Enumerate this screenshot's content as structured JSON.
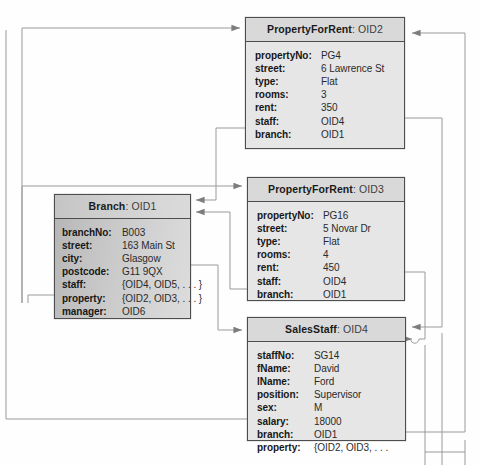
{
  "diagram": {
    "colors": {
      "box_border": "#4d4d4d",
      "title_fill": "#d9d9d9",
      "body_fill": "#e6e6e6",
      "branch_fill": "#c9c9c9",
      "connector": "#9a9a9a",
      "text": "#171717",
      "page": "#fefefe"
    },
    "objects": [
      {
        "id": "property-oid2",
        "class_name": "PropertyForRent",
        "separator": ":",
        "oid": "OID2",
        "attributes": [
          {
            "key": "propertyNo:",
            "value": "PG4"
          },
          {
            "key": "street:",
            "value": "6 Lawrence St"
          },
          {
            "key": "type:",
            "value": "Flat"
          },
          {
            "key": "rooms:",
            "value": "3"
          },
          {
            "key": "rent:",
            "value": "350"
          },
          {
            "key": "staff:",
            "value": "OID4"
          },
          {
            "key": "branch:",
            "value": "OID1"
          }
        ]
      },
      {
        "id": "property-oid3",
        "class_name": "PropertyForRent",
        "separator": ":",
        "oid": "OID3",
        "attributes": [
          {
            "key": "propertyNo:",
            "value": "PG16"
          },
          {
            "key": "street:",
            "value": "5 Novar Dr"
          },
          {
            "key": "type:",
            "value": "Flat"
          },
          {
            "key": "rooms:",
            "value": "4"
          },
          {
            "key": "rent:",
            "value": "450"
          },
          {
            "key": "staff:",
            "value": "OID4"
          },
          {
            "key": "branch:",
            "value": "OID1"
          }
        ]
      },
      {
        "id": "branch-oid1",
        "class_name": "Branch",
        "separator": ":",
        "oid": "OID1",
        "attributes": [
          {
            "key": "branchNo:",
            "value": "B003"
          },
          {
            "key": "street:",
            "value": "163 Main St"
          },
          {
            "key": "city:",
            "value": "Glasgow"
          },
          {
            "key": "postcode:",
            "value": "G11 9QX"
          },
          {
            "key": "staff:",
            "value": "{OID4, OID5, . . . }"
          },
          {
            "key": "property:",
            "value": "{OID2, OID3, . . . }"
          },
          {
            "key": "manager:",
            "value": "OID6"
          }
        ]
      },
      {
        "id": "salesstaff-oid4",
        "class_name": "SalesStaff",
        "separator": ":",
        "oid": "OID4",
        "attributes": [
          {
            "key": "staffNo:",
            "value": "SG14"
          },
          {
            "key": "fName:",
            "value": "David"
          },
          {
            "key": "lName:",
            "value": "Ford"
          },
          {
            "key": "position:",
            "value": "Supervisor"
          },
          {
            "key": "sex:",
            "value": "M"
          },
          {
            "key": "salary:",
            "value": "18000"
          },
          {
            "key": "branch:",
            "value": "OID1"
          },
          {
            "key": "property:",
            "value": "{OID2, OID3, . . ."
          }
        ]
      }
    ]
  }
}
